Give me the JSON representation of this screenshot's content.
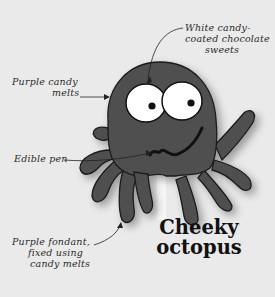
{
  "illustration": {
    "subject": "octopus-lollipop",
    "colors": {
      "background": "#eaeaea",
      "body": "#505050",
      "outline": "#1a1a1a",
      "eye_white": "#ffffff",
      "pupil": "#111111",
      "stick": "#f4f4f4"
    }
  },
  "title": {
    "line1": "Cheeky",
    "line2": "octopus"
  },
  "annotations": [
    {
      "id": "eyes",
      "lines": [
        "White candy-",
        "coated chocolate",
        "sweets"
      ]
    },
    {
      "id": "body",
      "lines": [
        "Purple candy",
        "melts"
      ]
    },
    {
      "id": "mouth",
      "lines": [
        "Edible pen"
      ]
    },
    {
      "id": "tentacles",
      "lines": [
        "Purple fondant,",
        "fixed using",
        "candy melts"
      ]
    }
  ]
}
